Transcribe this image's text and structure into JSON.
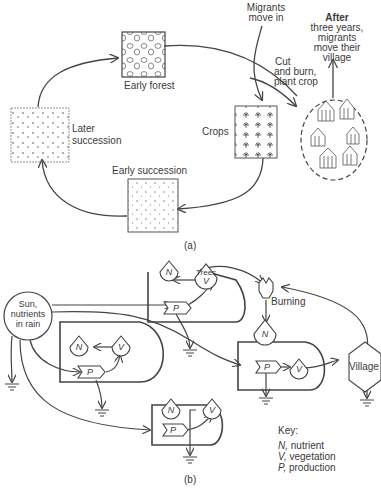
{
  "figure_a": {
    "caption": "(a)",
    "stages": {
      "early_forest": "Early forest",
      "crops": "Crops",
      "early_succession": "Early succession",
      "later_succession_line1": "Later",
      "later_succession_line2": "succession"
    },
    "annotations": {
      "migrants_line1": "Migrants",
      "migrants_line2": "move in",
      "cut_line1": "Cut",
      "cut_line2": "and burn,",
      "cut_line3": "plant crop",
      "after_line1": "After",
      "after_line2": "three years,",
      "after_line3": "migrants",
      "after_line4": "move their",
      "after_line5": "village"
    }
  },
  "figure_b": {
    "caption": "(b)",
    "source_line1": "Sun,",
    "source_line2": "nutrients",
    "source_line3": "in rain",
    "node_n": "N",
    "node_v": "V",
    "node_p": "P",
    "trees_label": "Trees",
    "burning_label": "Burning",
    "village_label": "Village"
  },
  "key": {
    "title": "Key:",
    "items": [
      {
        "symbol": "N,",
        "text": "nutrient"
      },
      {
        "symbol": "V,",
        "text": "vegetation"
      },
      {
        "symbol": "P,",
        "text": "production"
      }
    ]
  }
}
